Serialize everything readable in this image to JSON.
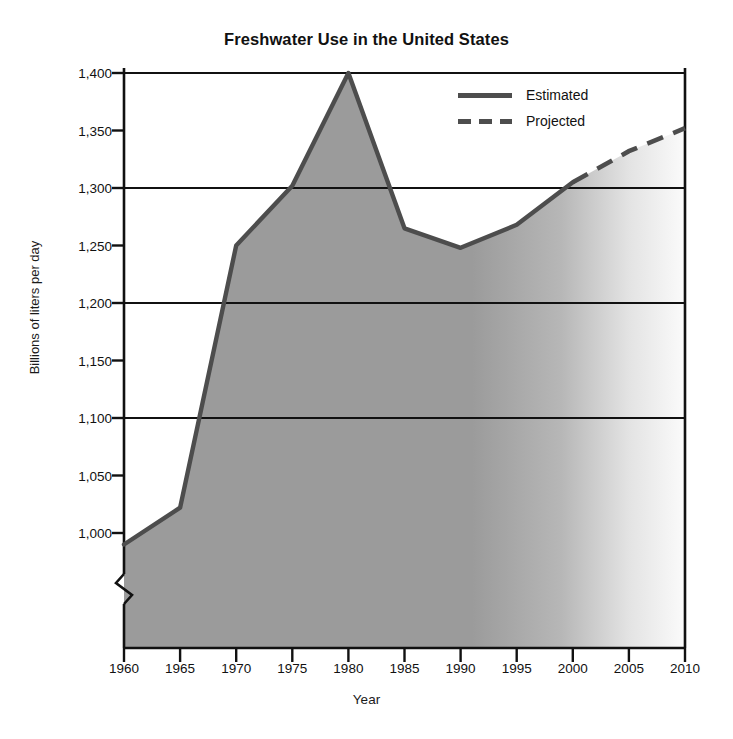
{
  "chart_data": {
    "type": "area",
    "title": "Freshwater Use in the United States",
    "xlabel": "Year",
    "ylabel": "Billions of liters per day",
    "x": [
      1960,
      1965,
      1970,
      1975,
      1980,
      1985,
      1990,
      1995,
      2000,
      2005,
      2010
    ],
    "xtick_labels": [
      "1960",
      "1965",
      "1970",
      "1975",
      "1980",
      "1985",
      "1990",
      "1995",
      "2000",
      "2005",
      "2010"
    ],
    "xlim": [
      1960,
      2010
    ],
    "ytick_values": [
      1000,
      1050,
      1100,
      1150,
      1200,
      1250,
      1300,
      1350,
      1400
    ],
    "ytick_labels": [
      "1,000",
      "1,050",
      "1,100",
      "1,150",
      "1,200",
      "1,250",
      "1,300",
      "1,350",
      "1,400"
    ],
    "ylim": [
      1000,
      1400
    ],
    "y_axis_break": true,
    "gridlines_at": [
      1100,
      1200,
      1300,
      1400
    ],
    "grid": true,
    "legend_position": "upper right",
    "series": [
      {
        "name": "Estimated",
        "style": "solid",
        "x": [
          1960,
          1965,
          1970,
          1975,
          1980,
          1985,
          1990,
          1995,
          2000
        ],
        "values": [
          990,
          1022,
          1250,
          1302,
          1400,
          1265,
          1248,
          1268,
          1305
        ]
      },
      {
        "name": "Projected",
        "style": "dashed",
        "x": [
          2000,
          2005,
          2010
        ],
        "values": [
          1305,
          1332,
          1352
        ]
      }
    ],
    "area_fill": "#9b9b9b",
    "area_fade_right": true,
    "line_color": "#4d4d4d"
  },
  "legend": {
    "entries": [
      {
        "label": "Estimated",
        "style": "solid"
      },
      {
        "label": "Projected",
        "style": "dashed"
      }
    ]
  },
  "colors": {
    "line": "#4d4d4d",
    "fill": "#9b9b9b",
    "axis": "#111111",
    "text": "#1a1a1a"
  }
}
